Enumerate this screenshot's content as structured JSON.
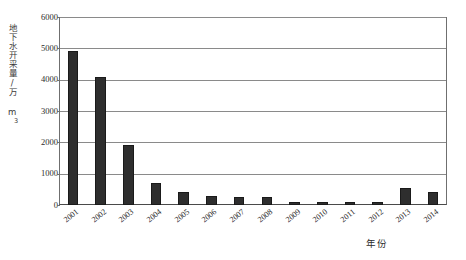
{
  "chart_data": {
    "type": "bar",
    "title": "",
    "xlabel": "年份",
    "ylabel": "地下水开采量/万 m³",
    "categories": [
      "2001",
      "2002",
      "2003",
      "2004",
      "2005",
      "2006",
      "2007",
      "2008",
      "2009",
      "2010",
      "2011",
      "2012",
      "2013",
      "2014"
    ],
    "values": [
      4900,
      4100,
      1900,
      700,
      420,
      280,
      250,
      250,
      90,
      100,
      90,
      90,
      550,
      430
    ],
    "ylim": [
      0,
      6000
    ],
    "yticks": [
      0,
      1000,
      2000,
      3000,
      4000,
      5000,
      6000
    ],
    "ytick_labels": [
      "0",
      "1000",
      "2000",
      "3000",
      "4000",
      "5000",
      "6000"
    ],
    "grid": true,
    "legend": "none",
    "bar_color": "#2e2e2e",
    "axis_color": "#6f6f6f",
    "grid_color": "#8a8a8a"
  },
  "axes": {
    "ylabel_main": "地下水开采量/万 m",
    "ylabel_superscript": "3",
    "xlabel": "年份"
  }
}
